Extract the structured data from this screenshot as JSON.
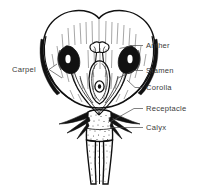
{
  "figure": {
    "style": "black-and-white line drawing",
    "background_color": "#ffffff",
    "ink_color": "#111111",
    "label_color": "#3a3a3a",
    "leader_color": "#4a4a4a"
  },
  "labels": [
    {
      "id": "anther",
      "text": "Anther",
      "side": "right",
      "text_x": 146,
      "text_y": 48,
      "leader": "M 143 45.5 L 133 45.5 L 119.5 48.5"
    },
    {
      "id": "stamen",
      "text": "Stamen",
      "side": "right",
      "text_x": 146,
      "text_y": 73,
      "leader": "M 143 70.5 L 134 70.5 L 118 78"
    },
    {
      "id": "corolla",
      "text": "Corolla",
      "side": "right",
      "text_x": 146,
      "text_y": 90,
      "leader": "M 143 87.5 L 135 87.5 L 127 80"
    },
    {
      "id": "receptacle",
      "text": "Receptacle",
      "side": "right",
      "text_x": 146,
      "text_y": 111,
      "leader": "M 143 108.5 L 134 108.5 L 110 122"
    },
    {
      "id": "calyx",
      "text": "Calyx",
      "side": "right",
      "text_x": 146,
      "text_y": 130,
      "leader": "M 143 127.5 L 110 127.5"
    },
    {
      "id": "carpel",
      "text": "Carpel",
      "side": "left",
      "text_x": 18,
      "text_y": 72,
      "leader": "M 49 69.5 L 57 64 M 49 69.5 L 62 78"
    }
  ],
  "parts": [
    {
      "id": "corolla",
      "name": "Corolla",
      "description": "fused bell-shaped petals forming the outer cup with a notched top"
    },
    {
      "id": "anther",
      "name": "Anther",
      "description": "two dark pollen-bearing sacs on the stamen filaments"
    },
    {
      "id": "stamen",
      "name": "Stamen",
      "description": "filament with anther, male reproductive organ"
    },
    {
      "id": "carpel",
      "name": "Carpel",
      "description": "stigma, style and ovary with ovule, female reproductive organ"
    },
    {
      "id": "receptacle",
      "name": "Receptacle",
      "description": "swollen stem tip bearing the floral parts"
    },
    {
      "id": "calyx",
      "name": "Calyx",
      "description": "whorl of pointed sepals below the corolla"
    },
    {
      "id": "stem",
      "name": "Stem",
      "description": "stippled pedicel descending from the receptacle"
    }
  ]
}
